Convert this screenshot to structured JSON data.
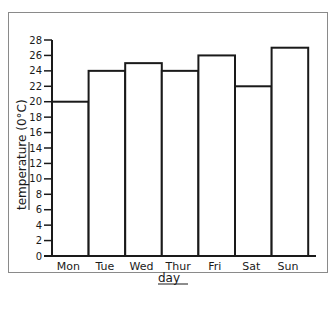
{
  "chart_data": {
    "type": "bar",
    "title": "",
    "xlabel": "day",
    "ylabel": "temperature (0°C)",
    "categories": [
      "Mon",
      "Tue",
      "Wed",
      "Thur",
      "Fri",
      "Sat",
      "Sun"
    ],
    "values": [
      20,
      24,
      25,
      24,
      26,
      22,
      27
    ],
    "ylim": [
      0,
      28
    ],
    "yticks": [
      0,
      2,
      4,
      6,
      8,
      10,
      12,
      14,
      16,
      18,
      20,
      22,
      24,
      26,
      28
    ],
    "grid": false,
    "legend": null,
    "bar_fill": "#ffffff",
    "bar_stroke": "#1a1a1a"
  }
}
